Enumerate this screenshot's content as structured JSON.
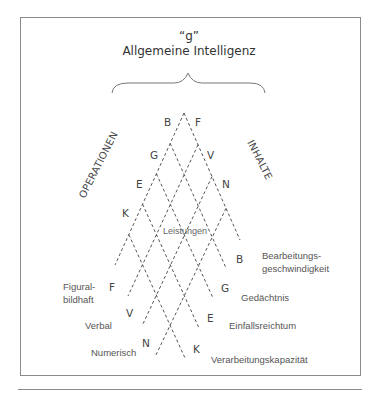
{
  "diagram": {
    "title_symbol": "“g”",
    "title": "Allgemeine Intelligenz",
    "axis_operations": "OPERATIONEN",
    "axis_contents": "INHALTE",
    "center_label": "Leistungen",
    "operations_top": [
      {
        "letter": "B"
      },
      {
        "letter": "G"
      },
      {
        "letter": "E"
      },
      {
        "letter": "K"
      }
    ],
    "contents_top": [
      {
        "letter": "F"
      },
      {
        "letter": "V"
      },
      {
        "letter": "N"
      }
    ],
    "operations_bottom": [
      {
        "letter": "B",
        "label_line1": "Bearbeitungs-",
        "label_line2": "geschwindigkeit"
      },
      {
        "letter": "G",
        "label": "Gedächtnis"
      },
      {
        "letter": "E",
        "label": "Einfallsreichtum"
      },
      {
        "letter": "K",
        "label": "Verarbeitungskapazität"
      }
    ],
    "contents_bottom": [
      {
        "letter": "F",
        "label_line1": "Figural-",
        "label_line2": "bildhaft"
      },
      {
        "letter": "V",
        "label": "Verbal"
      },
      {
        "letter": "N",
        "label": "Numerisch"
      }
    ]
  }
}
